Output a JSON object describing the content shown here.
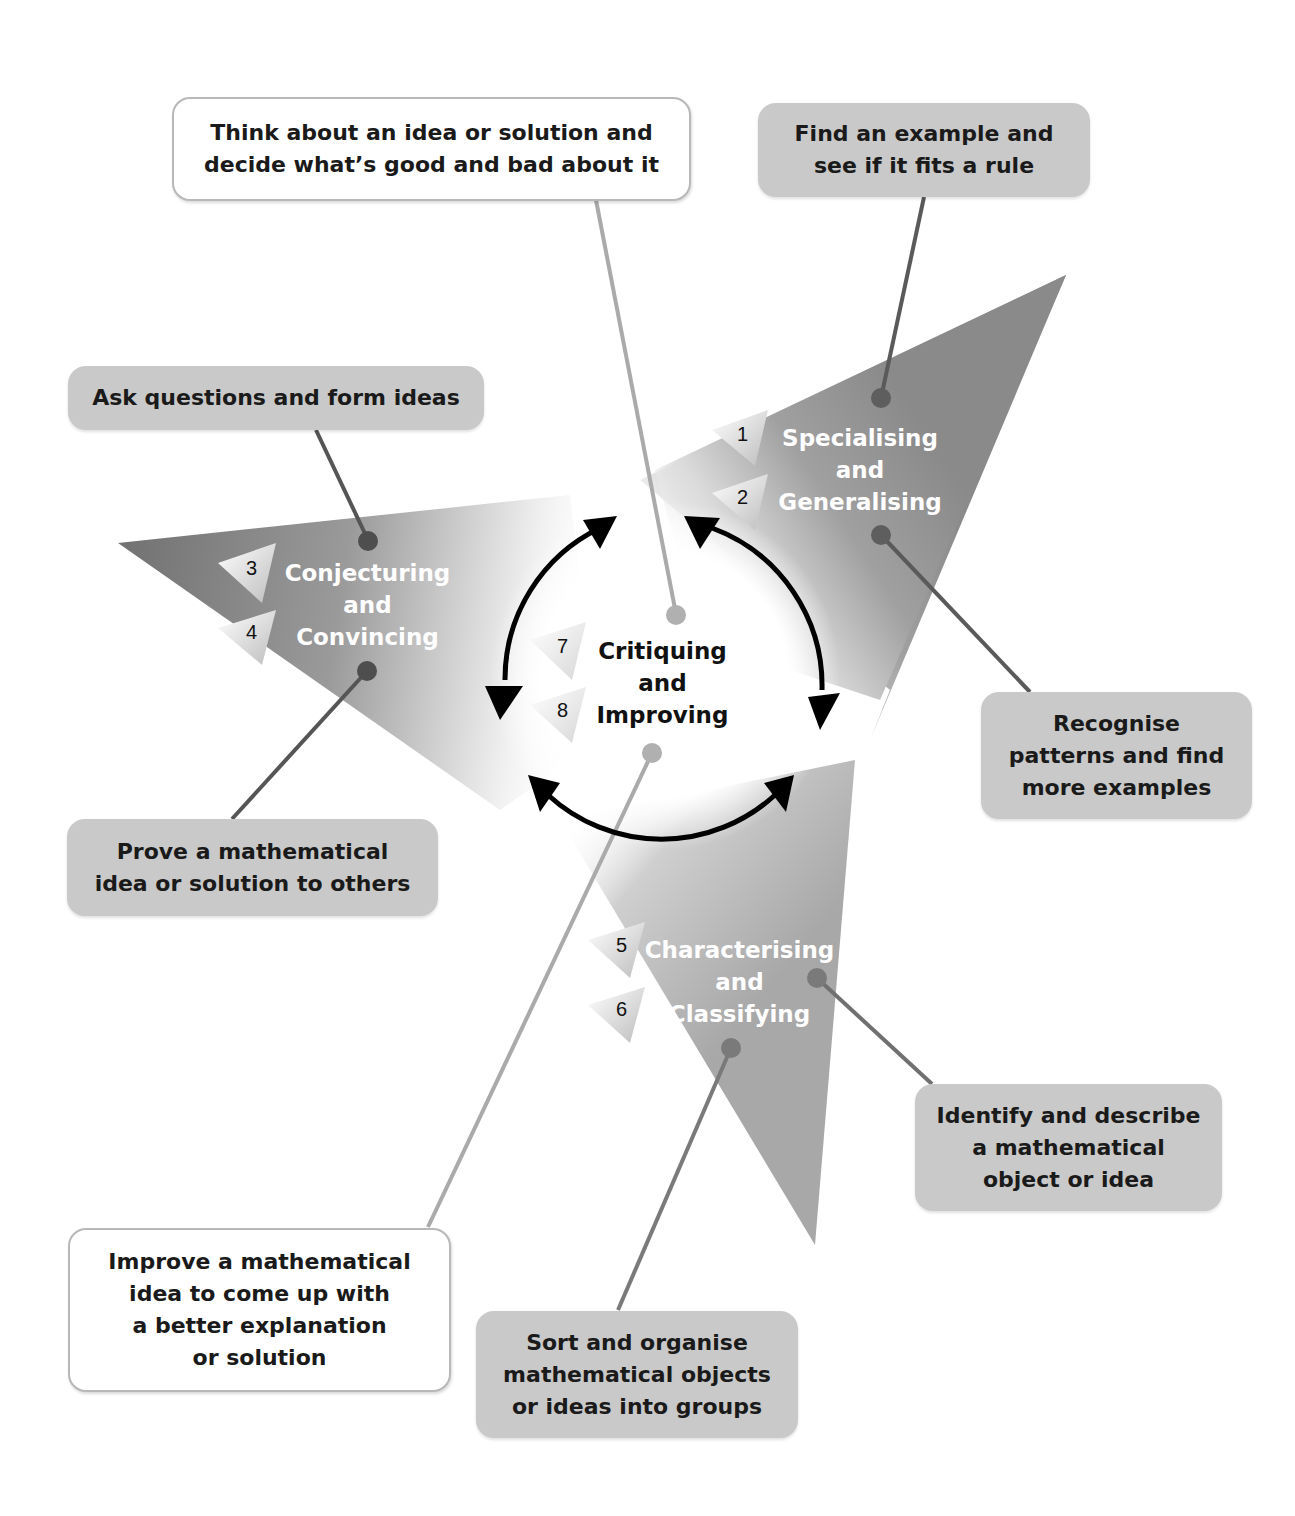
{
  "diagram": {
    "centre": {
      "label": "Critiquing\nand\nImproving",
      "numbers": [
        "7",
        "8"
      ]
    },
    "skills": [
      {
        "id": "specialising",
        "label": "Specialising\nand\nGeneralising",
        "numbers": [
          "1",
          "2"
        ]
      },
      {
        "id": "conjecturing",
        "label": "Conjecturing\nand\nConvincing",
        "numbers": [
          "3",
          "4"
        ]
      },
      {
        "id": "characterising",
        "label": "Characterising\nand\nClassifying",
        "numbers": [
          "5",
          "6"
        ]
      }
    ],
    "descriptions": {
      "critique_top": "Think about an idea or solution and\ndecide what’s good and bad about it",
      "find_example": "Find an example and\nsee if it fits a rule",
      "ask_questions": "Ask questions and form ideas",
      "recognise_patterns": "Recognise\npatterns and find\nmore examples",
      "prove_idea": "Prove a mathematical\nidea or solution to others",
      "identify_describe": "Identify and describe\na mathematical\nobject or idea",
      "improve_idea": "Improve a mathematical\nidea to come up with\na better explanation\nor solution",
      "sort_organise": "Sort and organise\nmathematical objects\nor ideas into groups"
    },
    "colors": {
      "triangle_grey": "#8e8e8e",
      "conjecturing_grey": "#7c7c7c",
      "characterising_grey": "#a8a8a8",
      "box_grey": "#c9c9c9",
      "connector_dark": "#5a5a5a",
      "connector_light": "#a9a9a9"
    }
  }
}
